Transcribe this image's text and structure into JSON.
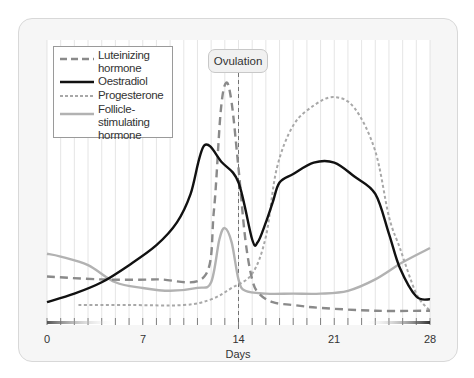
{
  "colors": {
    "lh": "#8a8a8a",
    "oestradiol": "#111111",
    "progesterone": "#a8a8a8",
    "fsh": "#b2b2b2",
    "grid": "#dedede",
    "card_bg": "#f6f6f6"
  },
  "legend": {
    "items": [
      {
        "label_line1": "Luteinizing",
        "label_line2": "hormone",
        "style": "dashed"
      },
      {
        "label_line1": "Oestradiol",
        "label_line2": "",
        "style": "solid-black"
      },
      {
        "label_line1": "Progesterone",
        "label_line2": "",
        "style": "dotted"
      },
      {
        "label_line1": "Follicle-stimulating",
        "label_line2": "hormone",
        "style": "solid-gray"
      }
    ]
  },
  "annotation": {
    "ovulation_label": "Ovulation",
    "ovulation_day": 14
  },
  "axis": {
    "xlabel": "Days",
    "ticks": [
      "0",
      "7",
      "14",
      "21",
      "28"
    ]
  },
  "chart_data": {
    "type": "line",
    "title": "",
    "xlabel": "Days",
    "ylabel": "",
    "xlim": [
      0,
      28
    ],
    "ylim": [
      0,
      100
    ],
    "x_ticks": [
      0,
      7,
      14,
      21,
      28
    ],
    "grid": "vertical lines every day",
    "legend_position": "upper left",
    "annotations": [
      {
        "text": "Ovulation",
        "x": 14,
        "style": "dashed vertical line with label box"
      }
    ],
    "units_note": "relative hormone level (no y-axis scale shown); estimated from pixel positions",
    "series": [
      {
        "name": "Luteinizing hormone",
        "style": "dashed",
        "x": [
          0,
          4,
          8,
          11.5,
          12.2,
          12.7,
          13.1,
          13.5,
          14,
          14.5,
          15,
          15.5,
          16.5,
          18,
          20,
          24,
          28
        ],
        "values": [
          17,
          16,
          16,
          17,
          40,
          75,
          85,
          78,
          55,
          30,
          16,
          11,
          8,
          7,
          6,
          5,
          5
        ]
      },
      {
        "name": "Oestradiol",
        "style": "solid-black",
        "x": [
          0,
          2,
          4,
          6,
          8,
          9.5,
          10.5,
          11.5,
          12.8,
          14,
          15,
          15.4,
          16,
          16.5,
          17,
          18,
          19.5,
          21,
          22.5,
          24,
          25,
          25.8,
          27,
          28
        ],
        "values": [
          8,
          11,
          15,
          21,
          28,
          36,
          46,
          63,
          57,
          50,
          30,
          29,
          36,
          43,
          50,
          53,
          57,
          57,
          52,
          46,
          32,
          20,
          10,
          9
        ]
      },
      {
        "name": "Progesterone",
        "style": "dotted",
        "x": [
          2.3,
          6,
          10,
          12,
          13.5,
          15,
          16,
          16.8,
          18,
          19.5,
          21,
          22.5,
          24,
          25,
          25.8,
          27,
          28
        ],
        "values": [
          7,
          7,
          7,
          9,
          13,
          18,
          31,
          55,
          70,
          77,
          80,
          76,
          61,
          38,
          27,
          11,
          5
        ]
      },
      {
        "name": "Follicle-stimulating hormone",
        "style": "solid-gray",
        "x": [
          0,
          1,
          3,
          5,
          7,
          9,
          11,
          12,
          12.6,
          13,
          13.5,
          14,
          14.5,
          16,
          18,
          20,
          22,
          24,
          26,
          28
        ],
        "values": [
          25,
          24,
          21,
          15,
          13,
          12,
          13,
          15,
          30,
          34,
          29,
          16,
          12,
          11,
          11,
          11,
          12,
          16,
          22,
          27
        ]
      }
    ]
  }
}
